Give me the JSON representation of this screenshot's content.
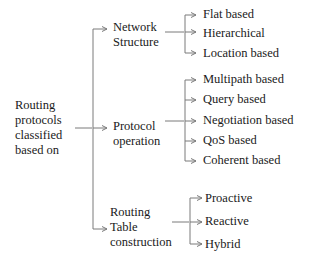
{
  "root": {
    "lines": [
      "Routing",
      "protocols",
      "classified",
      "based on"
    ]
  },
  "categories": [
    {
      "id": "network",
      "lines": [
        "Network",
        "Structure"
      ],
      "children": [
        "Flat based",
        "Hierarchical",
        "Location based"
      ]
    },
    {
      "id": "protocol",
      "lines": [
        "Protocol",
        "operation"
      ],
      "children": [
        "Multipath based",
        "Query based",
        "Negotiation based",
        "QoS based",
        "Coherent based"
      ]
    },
    {
      "id": "routing-table",
      "lines": [
        "Routing",
        "Table",
        "construction"
      ],
      "children": [
        "Proactive",
        "Reactive",
        "Hybrid"
      ]
    }
  ],
  "colors": {
    "line": "#7a7a7a",
    "text": "#1a1a1a",
    "background": "#ffffff"
  }
}
